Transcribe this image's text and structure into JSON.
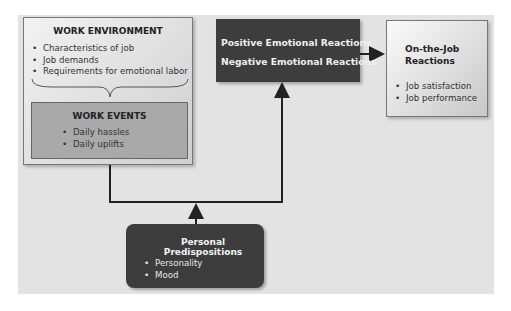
{
  "diagram": {
    "work_environment": {
      "title": "WORK ENVIRONMENT",
      "items": [
        "Characteristics of job",
        "Job demands",
        "Requirements for emotional labor"
      ]
    },
    "work_events": {
      "title": "WORK EVENTS",
      "items": [
        "Daily hassles",
        "Daily uplifts"
      ]
    },
    "emotional_reactions": {
      "positive": "Positive Emotional Reactions",
      "negative": "Negative Emotional Reactions"
    },
    "on_the_job": {
      "title_line1": "On-the-Job",
      "title_line2": "Reactions",
      "items": [
        "Job satisfaction",
        "Job performance"
      ]
    },
    "personal": {
      "title": "Personal Predispositions",
      "items": [
        "Personality",
        "Mood"
      ]
    },
    "colors": {
      "dark_box": "#3d3d3d",
      "panel": "#e3e3e3",
      "events_box": "#a9a9a9"
    }
  }
}
